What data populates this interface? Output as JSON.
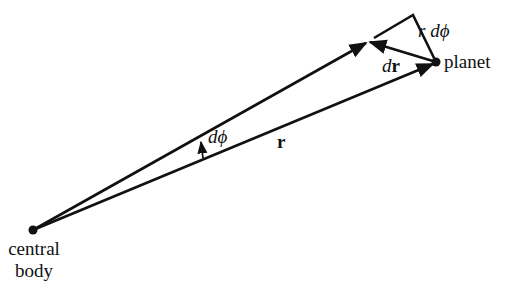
{
  "diagram": {
    "points": {
      "central_body": {
        "x": 33,
        "y": 230,
        "label_line1": "central",
        "label_line2": "body"
      },
      "planet": {
        "x": 436,
        "y": 62,
        "label": "planet"
      },
      "r_tip_after": {
        "x": 368,
        "y": 42
      },
      "perp_corner": {
        "x": 413,
        "y": 15
      },
      "perp_start": {
        "x": 374,
        "y": 38
      }
    },
    "labels": {
      "r_dphi_r": "r",
      "r_dphi_d": "d",
      "r_dphi_phi": "ϕ",
      "dr_d": "d",
      "dr_r": "r",
      "dphi_d": "d",
      "dphi_phi": "ϕ",
      "r_vector": "r"
    },
    "colors": {
      "stroke": "#111111",
      "background": "#ffffff"
    }
  }
}
